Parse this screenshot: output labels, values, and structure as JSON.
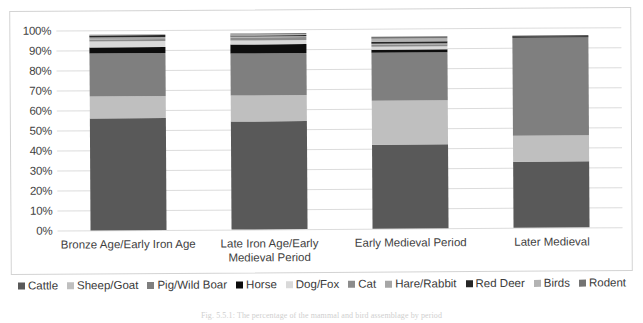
{
  "figure": {
    "caption": "Fig. 5.5.1: The percentage of the mammal and bird assemblage by period"
  },
  "chart_data": {
    "type": "bar",
    "stacked": true,
    "stack_mode": "percent",
    "title": "",
    "xlabel": "",
    "ylabel": "",
    "ylim": [
      0,
      100
    ],
    "grid": true,
    "legend_position": "bottom",
    "ytick_labels": [
      "100%",
      "90%",
      "80%",
      "70%",
      "60%",
      "50%",
      "40%",
      "30%",
      "20%",
      "10%",
      "0%"
    ],
    "ytick_values": [
      100,
      90,
      80,
      70,
      60,
      50,
      40,
      30,
      20,
      10,
      0
    ],
    "categories": [
      "Bronze Age/Early Iron Age",
      "Late Iron Age/Early Medieval Period",
      "Early Medieval Period",
      "Later Medieval"
    ],
    "series": [
      {
        "name": "Cattle",
        "color": "#595959",
        "values": [
          56.0,
          54.0,
          42.0,
          33.0
        ]
      },
      {
        "name": "Sheep/Goat",
        "color": "#bfbfbf",
        "values": [
          11.0,
          13.0,
          22.0,
          13.0
        ]
      },
      {
        "name": "Pig/Wild Boar",
        "color": "#7f7f7f",
        "values": [
          21.5,
          21.0,
          24.0,
          49.0
        ]
      },
      {
        "name": "Horse",
        "color": "#0d0d0d",
        "values": [
          2.8,
          4.5,
          1.5,
          0.7
        ]
      },
      {
        "name": "Dog/Fox",
        "color": "#d9d9d9",
        "values": [
          3.2,
          2.0,
          1.3,
          0.0
        ]
      },
      {
        "name": "Cat",
        "color": "#8c8c8c",
        "values": [
          1.2,
          1.3,
          1.2,
          0.0
        ]
      },
      {
        "name": "Hare/Rabbit",
        "color": "#a6a6a6",
        "values": [
          0.8,
          0.6,
          0.6,
          0.0
        ]
      },
      {
        "name": "Red Deer",
        "color": "#262626",
        "values": [
          1.0,
          0.8,
          1.0,
          0.3
        ]
      },
      {
        "name": "Birds",
        "color": "#b3b3b3",
        "values": [
          0.5,
          0.5,
          1.6,
          0.0
        ]
      },
      {
        "name": "Rodent",
        "color": "#737373",
        "values": [
          0.0,
          0.3,
          0.8,
          0.0
        ]
      }
    ],
    "bar_tops_percent": [
      98.0,
      98.0,
      96.0,
      96.0
    ]
  }
}
